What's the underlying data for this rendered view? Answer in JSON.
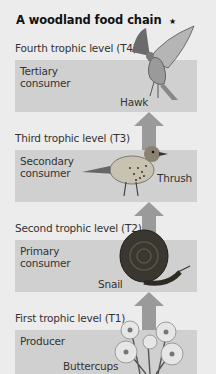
{
  "title": "A woodland food chain",
  "colors": {
    "background": "#ececec",
    "box": "#d0d0d0",
    "arrow": "#9a9a9a"
  },
  "levels": [
    {
      "label": "Fourth trophic level (T4)",
      "role": "Tertiary consumer",
      "organism": "Hawk",
      "icon": "hawk-icon"
    },
    {
      "label": "Third trophic level (T3)",
      "role": "Secondary consumer",
      "organism": "Thrush",
      "icon": "thrush-icon"
    },
    {
      "label": "Second trophic level (T2)",
      "role": "Primary consumer",
      "organism": "Snail",
      "icon": "snail-icon"
    },
    {
      "label": "First trophic level (T1)",
      "role": "Producer",
      "organism": "Buttercups",
      "icon": "buttercup-icon"
    }
  ],
  "star": "★"
}
